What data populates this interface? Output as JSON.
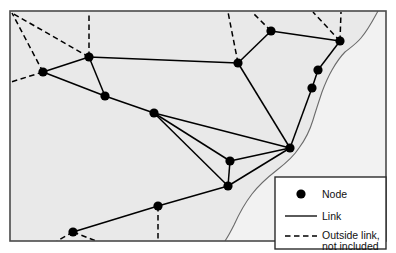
{
  "figure": {
    "type": "network-map",
    "background_color": "#e9e9e9",
    "frame_color": "#4a4a4a",
    "line_color": "#000000",
    "node_color": "#000000",
    "coastline_color": "#6b6b6b",
    "frame": {
      "x": 10,
      "y": 11,
      "width": 376,
      "height": 230
    }
  },
  "legend": {
    "box": {
      "x": 275,
      "y": 177,
      "width": 111,
      "height": 72
    },
    "background_color": "#ffffff",
    "border_color": "#2b2b2b",
    "entries": [
      {
        "symbol": "node-dot",
        "label": "Node"
      },
      {
        "symbol": "solid-line",
        "label": "Link"
      },
      {
        "symbol": "dashed-line",
        "label": "Outside link,",
        "label_line2": "not included"
      }
    ]
  },
  "chart_data": {
    "type": "scatter",
    "title": "",
    "xlabel": "",
    "ylabel": "",
    "nodes": [
      {
        "id": "n1",
        "x": 43,
        "y": 72
      },
      {
        "id": "n2",
        "x": 89,
        "y": 57
      },
      {
        "id": "n3",
        "x": 105,
        "y": 96
      },
      {
        "id": "n4",
        "x": 154,
        "y": 113
      },
      {
        "id": "n5",
        "x": 238,
        "y": 63
      },
      {
        "id": "n6",
        "x": 271,
        "y": 31
      },
      {
        "id": "n7",
        "x": 340,
        "y": 41
      },
      {
        "id": "n8",
        "x": 318,
        "y": 70
      },
      {
        "id": "n9",
        "x": 312,
        "y": 88
      },
      {
        "id": "n10",
        "x": 290,
        "y": 148
      },
      {
        "id": "n11",
        "x": 230,
        "y": 161
      },
      {
        "id": "n12",
        "x": 228,
        "y": 186
      },
      {
        "id": "n13",
        "x": 158,
        "y": 206
      },
      {
        "id": "n14",
        "x": 73,
        "y": 232
      }
    ],
    "links": [
      {
        "from": "n1",
        "to": "n2"
      },
      {
        "from": "n1",
        "to": "n3"
      },
      {
        "from": "n2",
        "to": "n3"
      },
      {
        "from": "n2",
        "to": "n5"
      },
      {
        "from": "n3",
        "to": "n4"
      },
      {
        "from": "n4",
        "to": "n10"
      },
      {
        "from": "n4",
        "to": "n11"
      },
      {
        "from": "n4",
        "to": "n12"
      },
      {
        "from": "n5",
        "to": "n6"
      },
      {
        "from": "n5",
        "to": "n10"
      },
      {
        "from": "n6",
        "to": "n7"
      },
      {
        "from": "n7",
        "to": "n8"
      },
      {
        "from": "n8",
        "to": "n9"
      },
      {
        "from": "n9",
        "to": "n10"
      },
      {
        "from": "n10",
        "to": "n11"
      },
      {
        "from": "n10",
        "to": "n12"
      },
      {
        "from": "n11",
        "to": "n12"
      },
      {
        "from": "n12",
        "to": "n13"
      },
      {
        "from": "n13",
        "to": "n14"
      }
    ],
    "outside_links": [
      {
        "from": "n1",
        "to_point": {
          "x": 12,
          "y": 13
        }
      },
      {
        "from": "n1",
        "to_point": {
          "x": 11,
          "y": 82
        }
      },
      {
        "from": "n2",
        "to_point": {
          "x": 12,
          "y": 13
        }
      },
      {
        "from": "n2",
        "to_point": {
          "x": 89,
          "y": 12
        }
      },
      {
        "from": "n5",
        "to_point": {
          "x": 228,
          "y": 12
        }
      },
      {
        "from": "n6",
        "to_point": {
          "x": 252,
          "y": 12
        }
      },
      {
        "from": "n7",
        "to_point": {
          "x": 313,
          "y": 12
        }
      },
      {
        "from": "n7",
        "to_point": {
          "x": 341,
          "y": 12
        }
      },
      {
        "from": "n13",
        "to_point": {
          "x": 158,
          "y": 240
        }
      },
      {
        "from": "n14",
        "to_point": {
          "x": 57,
          "y": 241
        }
      },
      {
        "from": "n14",
        "to_point": {
          "x": 96,
          "y": 241
        }
      }
    ],
    "coastline": "M 378,11 C 372,22 368,30 361,38 C 356,44 350,48 345,52 C 340,57 336,63 332,70 C 328,77 325,84 322,92 C 319,101 316,110 313,120 C 310,130 305,140 299,148 C 294,156 286,163 277,170 C 268,177 259,185 252,194 C 245,203 239,214 234,225 C 230,233 227,238 225,241"
  }
}
